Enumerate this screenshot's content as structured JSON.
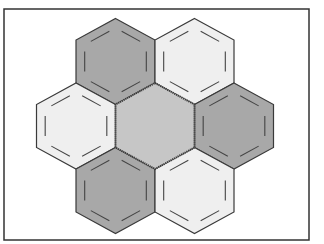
{
  "diagram": {
    "title": "",
    "frame": {
      "x": 4,
      "y": 9,
      "width": 305,
      "height": 231,
      "stroke": "#333333"
    },
    "hex_geometry": {
      "half_width": 39.5,
      "radius": 43
    },
    "colors": {
      "dark": "#a8a8a8",
      "light": "#efefef",
      "center": "#c6c6c6",
      "outline": "#3a3a3a",
      "inner_line": "#444444"
    },
    "hexagons": [
      {
        "id": "center",
        "cx": 155,
        "cy": 126,
        "fill": "center",
        "inner_lines": false
      },
      {
        "id": "top-left",
        "cx": 115.5,
        "cy": 61.5,
        "fill": "dark",
        "inner_lines": true
      },
      {
        "id": "top-right",
        "cx": 194.5,
        "cy": 61.5,
        "fill": "light",
        "inner_lines": true
      },
      {
        "id": "left",
        "cx": 76,
        "cy": 126,
        "fill": "light",
        "inner_lines": true
      },
      {
        "id": "right",
        "cx": 234,
        "cy": 126,
        "fill": "dark",
        "inner_lines": true
      },
      {
        "id": "bottom-left",
        "cx": 115.5,
        "cy": 190.5,
        "fill": "dark",
        "inner_lines": true
      },
      {
        "id": "bottom-right",
        "cx": 194.5,
        "cy": 190.5,
        "fill": "light",
        "inner_lines": true
      }
    ]
  }
}
